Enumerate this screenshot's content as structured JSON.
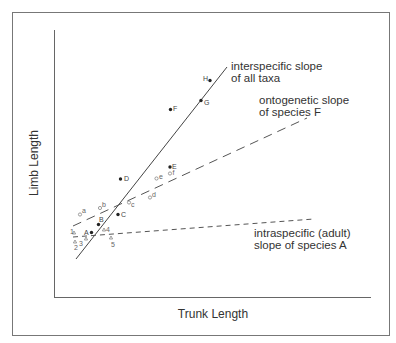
{
  "figure": {
    "x_axis_label": "Trunk Length",
    "y_axis_label": "Limb Length",
    "lines": [
      {
        "id": "interspecific",
        "label_line1": "interspecific slope",
        "label_line2": "of all taxa",
        "style": "solid"
      },
      {
        "id": "ontogenetic",
        "label_line1": "ontogenetic slope",
        "label_line2": "of species F",
        "style": "long-dash"
      },
      {
        "id": "intraspecific",
        "label_line1": "intraspecific (adult)",
        "label_line2": "slope of species A",
        "style": "short-dash"
      }
    ],
    "taxa_points": [
      {
        "label": "A"
      },
      {
        "label": "B"
      },
      {
        "label": "C"
      },
      {
        "label": "D"
      },
      {
        "label": "E"
      },
      {
        "label": "F"
      },
      {
        "label": "G"
      },
      {
        "label": "H"
      }
    ],
    "ontogenetic_points": [
      {
        "label": "a"
      },
      {
        "label": "b"
      },
      {
        "label": "c"
      },
      {
        "label": "d"
      },
      {
        "label": "e"
      },
      {
        "label": "f"
      }
    ],
    "intraspecific_points": [
      {
        "label": "1"
      },
      {
        "label": "2"
      },
      {
        "label": "3"
      },
      {
        "label": "4"
      },
      {
        "label": "5"
      }
    ]
  }
}
